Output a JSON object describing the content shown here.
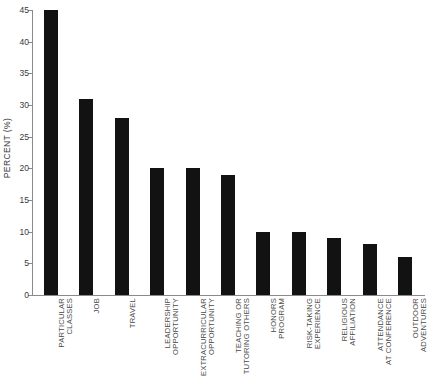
{
  "chart_data": {
    "type": "bar",
    "title": "",
    "xlabel": "",
    "ylabel": "PERCENT (%)",
    "ylim": [
      0,
      45
    ],
    "yticks": [
      0,
      5,
      10,
      15,
      20,
      25,
      30,
      35,
      40,
      45
    ],
    "grid": false,
    "legend": null,
    "bar_color": "#121212",
    "axis_color": "#8a8a8a",
    "categories": [
      "PARTICULAR\nCLASSES",
      "JOB",
      "TRAVEL",
      "LEADERSHIP\nOPPORTUNITY",
      "EXTRACURRICULAR\nOPPORTUNITY",
      "TEACHING OR\nTUTORING OTHERS",
      "HONORS\nPROGRAM",
      "RISK-TAKING\nEXPERIENCE",
      "RELIGIOUS\nAFFILIATION",
      "ATTENDANCE\nAT CONFERENCE",
      "OUTDOOR\nADVENTURES"
    ],
    "values": [
      45,
      31,
      28,
      20,
      20,
      19,
      10,
      10,
      9,
      8,
      6
    ]
  }
}
